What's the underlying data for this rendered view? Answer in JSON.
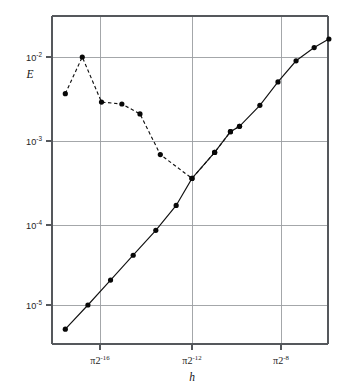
{
  "chart_data": {
    "type": "line",
    "title": "",
    "subtitle": "",
    "xlabel": "h",
    "ylabel": "E",
    "xscale": "log2",
    "yscale": "log10",
    "grid": true,
    "legend_position": "none",
    "xlim_exponents": [
      -18.1,
      -5.9
    ],
    "ylim": [
      3.2e-06,
      0.03
    ],
    "y_ticks": [
      {
        "value": 0.01,
        "mantissa": "10",
        "exponent": "-2",
        "label": "10^-2"
      },
      {
        "value": 0.001,
        "mantissa": "10",
        "exponent": "-3",
        "label": "10^-3"
      },
      {
        "value": 0.0001,
        "mantissa": "10",
        "exponent": "-4",
        "label": "10^-4"
      },
      {
        "value": 1e-05,
        "mantissa": "10",
        "exponent": "-5",
        "label": "10^-5"
      }
    ],
    "x_ticks": [
      {
        "exponent": -16,
        "prefix": "π2",
        "sup": "-16",
        "label": "π2^-16"
      },
      {
        "exponent": -12,
        "prefix": "π2",
        "sup": "-12",
        "label": "π2^-12"
      },
      {
        "exponent": -8,
        "prefix": "π2",
        "sup": "-8",
        "label": "π2^-8"
      }
    ],
    "series": [
      {
        "name": "solid-curve",
        "style": "solid",
        "marker": "filled-circle",
        "x_exponents": [
          -17.6,
          -16.6,
          -15.6,
          -14.6,
          -13.6,
          -12.7,
          -12.0,
          -11.0,
          -10.3,
          -9.9,
          -9.0,
          -8.2,
          -7.4,
          -6.6,
          -5.95
        ],
        "values": [
          5.1e-06,
          1e-05,
          2e-05,
          4e-05,
          8e-05,
          0.00016,
          0.00034,
          0.0007,
          0.00125,
          0.00145,
          0.0026,
          0.005,
          0.009,
          0.013,
          0.0165
        ]
      },
      {
        "name": "dashed-curve",
        "style": "dashed",
        "marker": "filled-circle",
        "x_exponents": [
          -17.6,
          -16.85,
          -16.0,
          -15.1,
          -14.3,
          -13.4,
          -12.0,
          -11.0,
          -10.3,
          -9.9
        ],
        "values": [
          0.0036,
          0.01,
          0.00285,
          0.0027,
          0.00205,
          0.00066,
          0.00034,
          0.0007,
          0.00125,
          0.00145
        ]
      }
    ],
    "colors": {
      "axis": "#55585c",
      "grid": "#9a9da1",
      "curve": "#111111",
      "marker": "#080808",
      "background": "#ffffff"
    }
  }
}
